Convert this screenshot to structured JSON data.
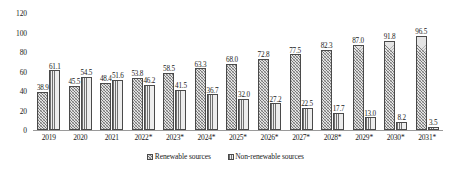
{
  "chart_data": {
    "type": "bar",
    "title": "",
    "xlabel": "",
    "ylabel": "",
    "ylim": [
      0,
      120
    ],
    "yticks": [
      0,
      20,
      40,
      60,
      80,
      100,
      120
    ],
    "grid": false,
    "legend_position": "bottom",
    "categories": [
      "2019",
      "2020",
      "2021",
      "2022*",
      "2023*",
      "2024*",
      "2025*",
      "2026*",
      "2027*",
      "2028*",
      "2029*",
      "2030*",
      "2031*"
    ],
    "series": [
      {
        "name": "Renewable sources",
        "values": [
          38.9,
          45.5,
          48.4,
          53.8,
          58.5,
          63.3,
          68.0,
          72.8,
          77.5,
          82.3,
          87.0,
          91.8,
          96.5
        ]
      },
      {
        "name": "Non-renewable sources",
        "values": [
          61.1,
          54.5,
          51.6,
          46.2,
          41.5,
          36.7,
          32.0,
          27.2,
          22.5,
          17.7,
          13.0,
          8.2,
          3.5
        ]
      }
    ]
  },
  "legend": {
    "items": [
      {
        "label": "Renewable sources"
      },
      {
        "label": "Non-renewable sources"
      }
    ]
  }
}
